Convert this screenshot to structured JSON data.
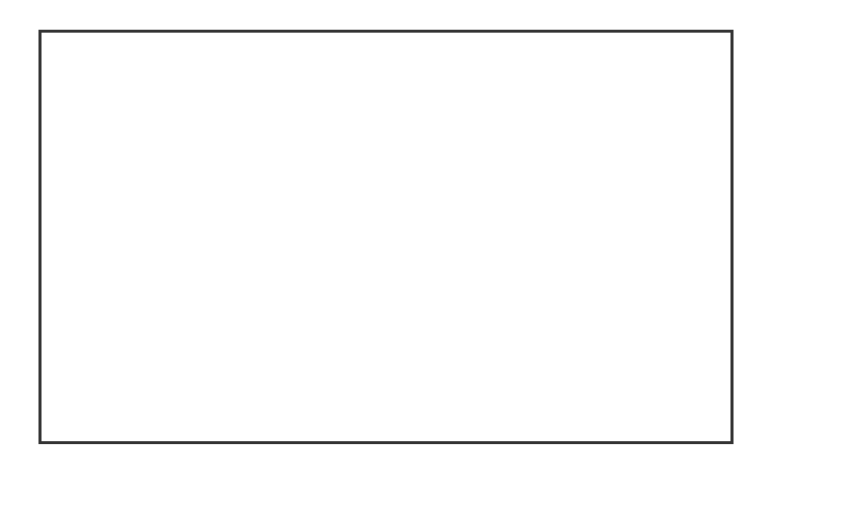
{
  "figure": {
    "type": "map",
    "regions": [
      {
        "id": "1",
        "x": 523,
        "y": 103
      },
      {
        "id": "2",
        "x": 494,
        "y": 163
      },
      {
        "id": "3",
        "x": 445,
        "y": 266
      },
      {
        "id": "4",
        "x": 398,
        "y": 129
      },
      {
        "id": "5",
        "x": 427,
        "y": 196
      },
      {
        "id": "6",
        "x": 431,
        "y": 233
      },
      {
        "id": "7",
        "x": 349,
        "y": 153
      },
      {
        "id": "8",
        "x": 358,
        "y": 273
      },
      {
        "id": "9",
        "x": 298,
        "y": 95
      },
      {
        "id": "10",
        "x": 252,
        "y": 145
      },
      {
        "id": "11",
        "x": 283,
        "y": 234
      },
      {
        "id": "12",
        "x": 300,
        "y": 299
      },
      {
        "id": "13",
        "x": 205,
        "y": 271
      },
      {
        "id": "14",
        "x": 184,
        "y": 190
      },
      {
        "id": "15",
        "x": 147,
        "y": 243
      },
      {
        "id": "16",
        "x": 124,
        "y": 168
      },
      {
        "id": "17",
        "x": 113,
        "y": 101
      },
      {
        "id": "18",
        "x": 77,
        "y": 206
      }
    ],
    "legend": [
      {
        "label": "21 Regions",
        "color": "#333333"
      },
      {
        "label": "2264 Watersheds",
        "color": "#333333"
      }
    ]
  }
}
